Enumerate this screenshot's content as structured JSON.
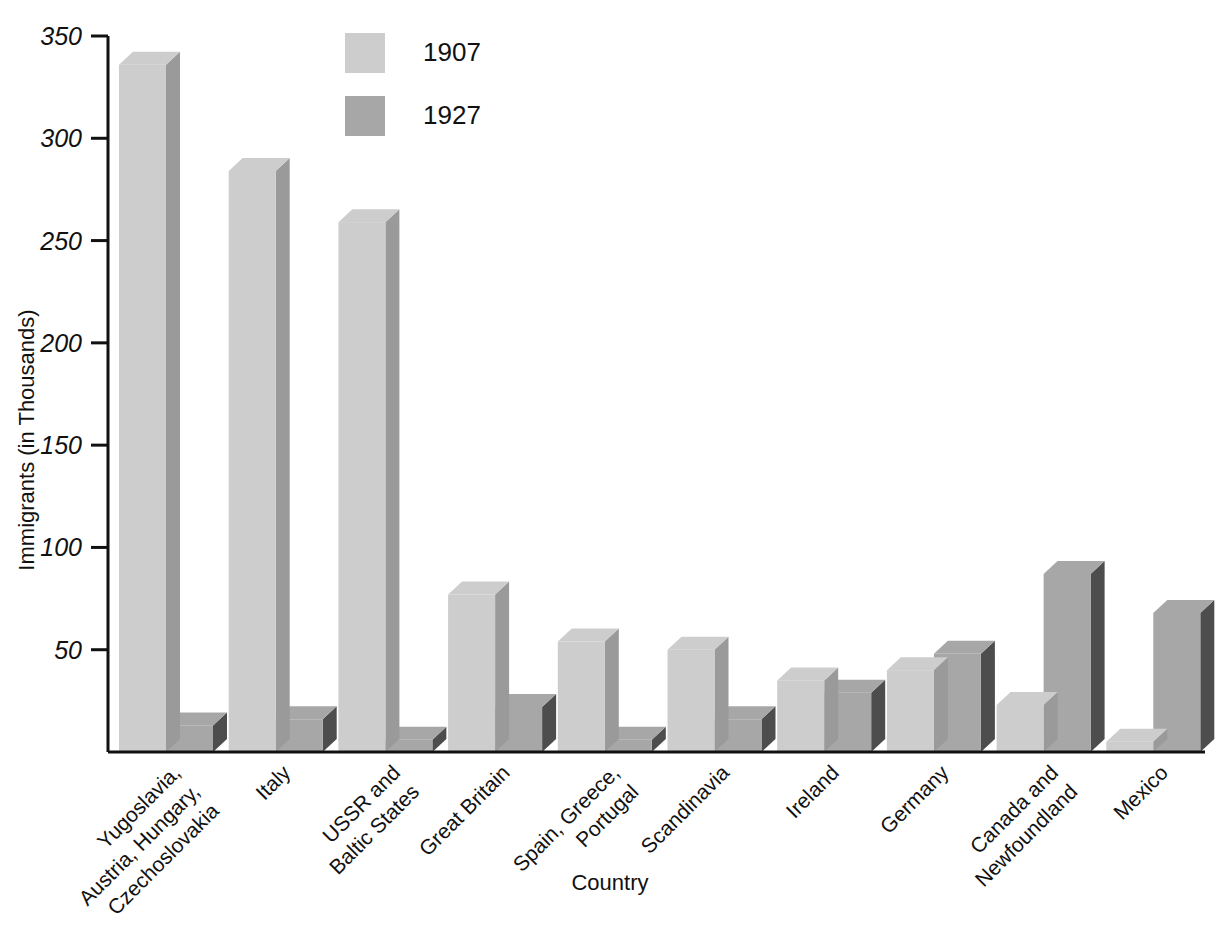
{
  "chart_data": {
    "type": "bar",
    "title": "",
    "xlabel": "Country",
    "ylabel": "Immigrants (in Thousands)",
    "ylim": [
      0,
      350
    ],
    "yticks": [
      50,
      100,
      150,
      200,
      250,
      300,
      350
    ],
    "ytick_labels": [
      "50",
      "100",
      "150",
      "200",
      "250",
      "300",
      "350"
    ],
    "grid": false,
    "legend_position": "top-center",
    "style": "3d-grouped-bar",
    "categories": [
      "Yugoslavia,\nAustria, Hungary,\nCzechoslovakia",
      "Italy",
      "USSR and\nBaltic States",
      "Great Britain",
      "Spain, Greece,\nPortugal",
      "Scandinavia",
      "Ireland",
      "Germany",
      "Canada and\nNewfoundland",
      "Mexico"
    ],
    "category_lines": [
      [
        "Yugoslavia,",
        "Austria, Hungary,",
        "Czechoslovakia"
      ],
      [
        "Italy"
      ],
      [
        "USSR and",
        "Baltic States"
      ],
      [
        "Great Britain"
      ],
      [
        "Spain, Greece,",
        "Portugal"
      ],
      [
        "Scandinavia"
      ],
      [
        "Ireland"
      ],
      [
        "Germany"
      ],
      [
        "Canada and",
        "Newfoundland"
      ],
      [
        "Mexico"
      ]
    ],
    "series": [
      {
        "name": "1907",
        "color": "#cdcdcd",
        "side_color": "#9a9a9a",
        "values": [
          336,
          284,
          259,
          77,
          54,
          50,
          35,
          40,
          23,
          5
        ]
      },
      {
        "name": "1927",
        "color": "#a7a7a7",
        "side_color": "#4d4d4d",
        "values": [
          13,
          16,
          6,
          22,
          6,
          16,
          29,
          48,
          87,
          68
        ]
      }
    ]
  },
  "legend": {
    "items": [
      {
        "label": "1907",
        "swatch": "#cdcdcd"
      },
      {
        "label": "1927",
        "swatch": "#a7a7a7"
      }
    ]
  },
  "axes": {
    "y_title": "Immigrants (in Thousands)",
    "x_title": "Country"
  }
}
